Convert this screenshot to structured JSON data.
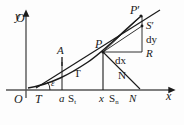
{
  "figure": {
    "kind": "calculus-tangent-normal-diagram",
    "background_color": "#fdfdfd",
    "ink_color": "#1a1a1a",
    "axes": {
      "x_label": "x",
      "y_label": "y",
      "origin_label": "O"
    },
    "labels": {
      "origin": "O",
      "tangent_foot": "T",
      "angle": "ε",
      "abscissa_a": "a",
      "subtangent_foot": "S",
      "subtangent_sub": "t",
      "point_a": "A",
      "tangent_segment": "T",
      "point_p": "P",
      "abscissa_x": "x",
      "subnormal_foot": "S",
      "subnormal_sub": "n",
      "normal_foot": "N",
      "normal_segment": "N",
      "point_p_prime": "P",
      "point_p_prime_mark": "′",
      "point_s_prime": "S",
      "point_s_prime_mark": "′",
      "differential_y": "dy",
      "differential_x": "dx",
      "corner_r": "R"
    }
  }
}
